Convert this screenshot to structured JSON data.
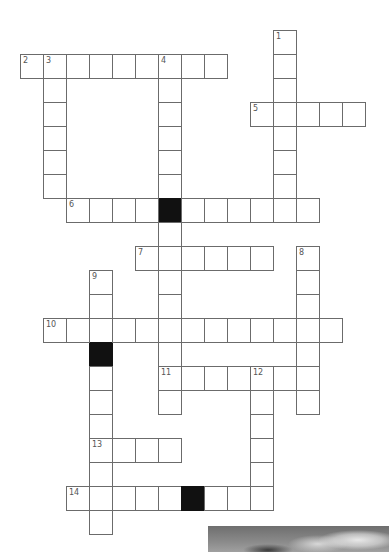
{
  "puzzle": {
    "type": "crossword",
    "grid_origin": {
      "x": 20,
      "y": 30
    },
    "cell_size": {
      "w": 23,
      "h": 24
    },
    "entries": [
      {
        "number": "1",
        "direction": "down",
        "row": 0,
        "col": 11,
        "length": 8,
        "blocks": []
      },
      {
        "number": "2",
        "direction": "across",
        "row": 1,
        "col": 0,
        "length": 9,
        "blocks": []
      },
      {
        "number": "3",
        "direction": "down",
        "row": 1,
        "col": 1,
        "length": 6,
        "blocks": []
      },
      {
        "number": "4",
        "direction": "down",
        "row": 1,
        "col": 6,
        "length": 15,
        "blocks": [
          6
        ]
      },
      {
        "number": "5",
        "direction": "across",
        "row": 3,
        "col": 10,
        "length": 5,
        "blocks": []
      },
      {
        "number": "6",
        "direction": "across",
        "row": 7,
        "col": 2,
        "length": 11,
        "blocks": [
          4
        ]
      },
      {
        "number": "7",
        "direction": "across",
        "row": 9,
        "col": 5,
        "length": 6,
        "blocks": []
      },
      {
        "number": "8",
        "direction": "down",
        "row": 9,
        "col": 12,
        "length": 7,
        "blocks": []
      },
      {
        "number": "9",
        "direction": "down",
        "row": 10,
        "col": 3,
        "length": 11,
        "blocks": [
          3
        ]
      },
      {
        "number": "10",
        "direction": "across",
        "row": 12,
        "col": 1,
        "length": 13,
        "blocks": []
      },
      {
        "number": "11",
        "direction": "across",
        "row": 14,
        "col": 6,
        "length": 7,
        "blocks": []
      },
      {
        "number": "12",
        "direction": "down",
        "row": 14,
        "col": 10,
        "length": 6,
        "blocks": []
      },
      {
        "number": "13",
        "direction": "across",
        "row": 17,
        "col": 3,
        "length": 4,
        "blocks": []
      },
      {
        "number": "14",
        "direction": "across",
        "row": 19,
        "col": 2,
        "length": 9,
        "blocks": [
          5
        ]
      }
    ]
  },
  "photo": {
    "description": "grayscale photo of cloudy sky over dark landscape silhouette",
    "position": {
      "x": 208,
      "y": 526,
      "w": 181,
      "h": 26
    }
  },
  "colors": {
    "cell_border": "#6b6b6b",
    "block": "#111111",
    "number": "#555555"
  }
}
